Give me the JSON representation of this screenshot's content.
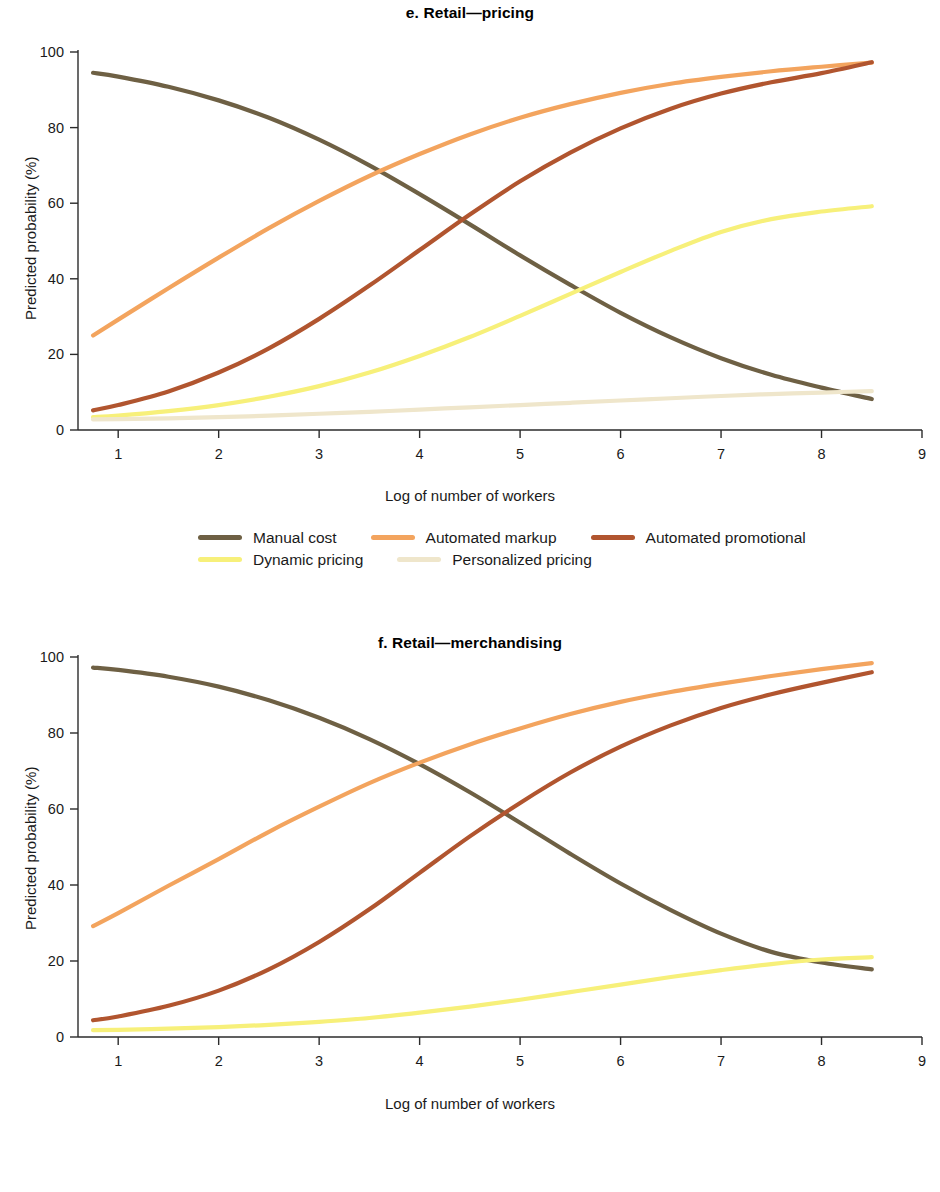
{
  "figure": {
    "panels": [
      {
        "id": "e",
        "title": "e. Retail—pricing",
        "xlabel": "Log of number of workers",
        "ylabel": "Predicted probability (%)"
      },
      {
        "id": "f",
        "title": "f. Retail—merchandising",
        "xlabel": "Log of number of workers",
        "ylabel": "Predicted probability (%)"
      }
    ]
  },
  "colors": {
    "manual": "#6E6044",
    "orange": "#F3A45E",
    "rust": "#B1552F",
    "yellow": "#F7F07A",
    "cream": "#EFE6CB"
  },
  "chart_data": [
    {
      "type": "line",
      "title": "e. Retail—pricing",
      "xlabel": "Log of number of workers",
      "ylabel": "Predicted probability (%)",
      "xlim": [
        0.6,
        9.0
      ],
      "ylim": [
        0,
        100
      ],
      "xticks": [
        1,
        2,
        3,
        4,
        5,
        6,
        7,
        8,
        9
      ],
      "yticks": [
        0,
        20,
        40,
        60,
        80,
        100
      ],
      "xtick_labels": [
        "1",
        "2",
        "3",
        "4",
        "5",
        "6",
        "7",
        "8",
        "9"
      ],
      "ytick_labels": [
        "0",
        "20",
        "40",
        "60",
        "80",
        "100"
      ],
      "grid": false,
      "legend_position": "below",
      "x": [
        0.75,
        1.0,
        1.5,
        2.0,
        2.5,
        3.0,
        3.5,
        4.0,
        4.5,
        5.0,
        5.5,
        6.0,
        6.5,
        7.0,
        7.5,
        8.0,
        8.5
      ],
      "series": [
        {
          "name": "Manual cost",
          "color": "#6E6044",
          "values": [
            94.5,
            93.5,
            90.8,
            87.2,
            82.6,
            76.8,
            70.0,
            62.4,
            54.4,
            46.2,
            38.4,
            31.0,
            24.5,
            19.0,
            14.6,
            11.2,
            8.2
          ]
        },
        {
          "name": "Automated markup",
          "color": "#F3A45E",
          "values": [
            25.0,
            29.2,
            37.5,
            45.6,
            53.4,
            60.6,
            67.2,
            73.0,
            78.2,
            82.6,
            86.2,
            89.2,
            91.6,
            93.4,
            94.9,
            96.1,
            97.2
          ]
        },
        {
          "name": "Automated promotional",
          "color": "#B1552F",
          "values": [
            5.2,
            6.6,
            10.2,
            15.2,
            21.6,
            29.4,
            38.2,
            47.6,
            57.0,
            65.8,
            73.4,
            79.8,
            85.0,
            89.0,
            92.0,
            94.4,
            97.3
          ]
        },
        {
          "name": "Dynamic pricing",
          "color": "#F7F07A",
          "values": [
            3.4,
            3.8,
            5.0,
            6.6,
            8.8,
            11.6,
            15.2,
            19.6,
            24.6,
            30.2,
            36.0,
            41.8,
            47.4,
            52.4,
            55.8,
            57.8,
            59.2
          ]
        },
        {
          "name": "Personalized pricing",
          "color": "#EFE6CB",
          "values": [
            2.8,
            2.9,
            3.1,
            3.4,
            3.8,
            4.3,
            4.8,
            5.4,
            6.0,
            6.6,
            7.2,
            7.8,
            8.4,
            9.0,
            9.5,
            9.9,
            10.3
          ]
        }
      ]
    },
    {
      "type": "line",
      "title": "f. Retail—merchandising",
      "xlabel": "Log of number of workers",
      "ylabel": "Predicted probability (%)",
      "xlim": [
        0.6,
        9.0
      ],
      "ylim": [
        0,
        100
      ],
      "xticks": [
        1,
        2,
        3,
        4,
        5,
        6,
        7,
        8,
        9
      ],
      "yticks": [
        0,
        20,
        40,
        60,
        80,
        100
      ],
      "xtick_labels": [
        "1",
        "2",
        "3",
        "4",
        "5",
        "6",
        "7",
        "8",
        "9"
      ],
      "ytick_labels": [
        "0",
        "20",
        "40",
        "60",
        "80",
        "100"
      ],
      "grid": false,
      "legend_position": "below",
      "x": [
        0.75,
        1.0,
        1.5,
        2.0,
        2.5,
        3.0,
        3.5,
        4.0,
        4.5,
        5.0,
        5.5,
        6.0,
        6.5,
        7.0,
        7.5,
        8.0,
        8.5
      ],
      "series": [
        {
          "name": "Manual selection",
          "color": "#6E6044",
          "values": [
            97.2,
            96.6,
            94.8,
            92.2,
            88.6,
            84.0,
            78.4,
            71.8,
            64.4,
            56.4,
            48.2,
            40.4,
            33.4,
            27.2,
            22.4,
            19.6,
            17.8
          ]
        },
        {
          "name": "Category management tools",
          "color": "#F3A45E",
          "values": [
            29.2,
            32.6,
            39.8,
            46.8,
            54.0,
            60.6,
            66.8,
            72.2,
            77.0,
            81.2,
            85.0,
            88.2,
            90.8,
            93.0,
            95.0,
            96.8,
            98.4
          ]
        },
        {
          "name": "Digital merchandising",
          "color": "#B1552F",
          "values": [
            4.4,
            5.4,
            8.2,
            12.2,
            17.8,
            25.0,
            33.6,
            43.2,
            52.8,
            61.6,
            69.6,
            76.4,
            82.0,
            86.6,
            90.2,
            93.2,
            96.0
          ]
        },
        {
          "name": "Product trend analytics",
          "color": "#F7F07A",
          "values": [
            1.8,
            1.9,
            2.2,
            2.6,
            3.2,
            4.0,
            5.0,
            6.4,
            8.0,
            9.8,
            11.8,
            13.8,
            15.8,
            17.6,
            19.2,
            20.4,
            21.0
          ]
        }
      ]
    }
  ],
  "legends": [
    {
      "rows": [
        [
          {
            "label": "Manual cost",
            "color": "#6E6044"
          },
          {
            "label": "Automated markup",
            "color": "#F3A45E"
          },
          {
            "label": "Automated promotional",
            "color": "#B1552F"
          }
        ],
        [
          {
            "label": "Dynamic pricing",
            "color": "#F7F07A"
          },
          {
            "label": "Personalized pricing",
            "color": "#EFE6CB"
          }
        ]
      ]
    },
    {
      "rows": [
        [
          {
            "label": "Manual selection",
            "color": "#6E6044"
          },
          {
            "label": "Category management tools",
            "color": "#F3A45E"
          },
          {
            "label": "Digital merchandising",
            "color": "#B1552F"
          },
          {
            "label": "Product trend analytics",
            "color": "#F7F07A"
          }
        ]
      ]
    }
  ]
}
